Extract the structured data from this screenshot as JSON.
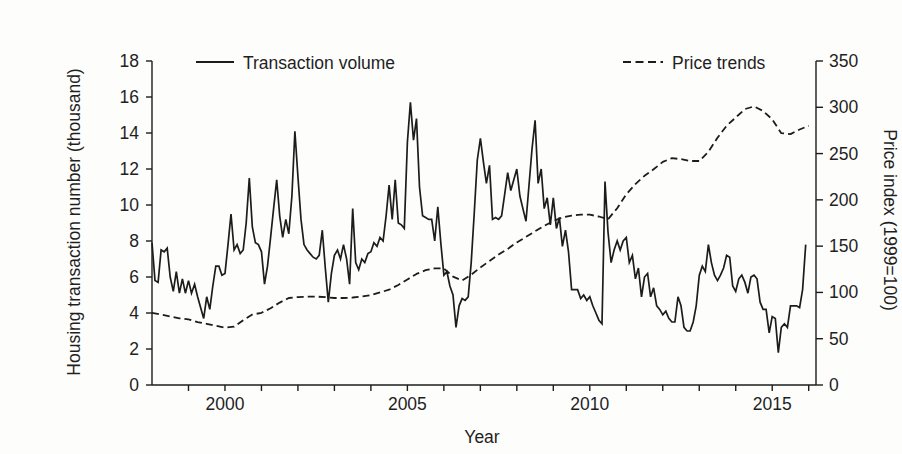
{
  "figure": {
    "colors": {
      "line": "#1c1c1c",
      "text": "#1f1f1f",
      "background": "#fdfdfc"
    }
  },
  "chart_data": {
    "type": "line",
    "title": "",
    "xlabel": "Year",
    "ylabel_left": "Housing transaction number (thousand)",
    "ylabel_right": "Price index (1999=100)",
    "x_range": [
      1998,
      2016.2
    ],
    "x_major_ticks": [
      2000,
      2005,
      2010,
      2015
    ],
    "x_minor_ticks": [
      1999,
      2000,
      2001,
      2002,
      2003,
      2004,
      2005,
      2006,
      2007,
      2008,
      2009,
      2010,
      2011,
      2012,
      2013,
      2014,
      2015,
      2016
    ],
    "yleft_range": [
      0,
      18
    ],
    "yleft_ticks": [
      0,
      2,
      4,
      6,
      8,
      10,
      12,
      14,
      16,
      18
    ],
    "yright_range": [
      0,
      350
    ],
    "yright_ticks": [
      0,
      50,
      100,
      150,
      200,
      250,
      300,
      350
    ],
    "grid": "off",
    "legend": {
      "position": "top",
      "items": [
        {
          "label": "Transaction volume",
          "style": "solid"
        },
        {
          "label": "Price trends",
          "style": "dashed"
        }
      ]
    },
    "series": [
      {
        "name": "Transaction volume",
        "axis": "left",
        "style": "solid",
        "x_start": 1998.0,
        "x_step": 0.083333,
        "values": [
          7.9,
          5.8,
          5.7,
          7.5,
          7.4,
          7.6,
          6.0,
          5.2,
          6.3,
          5.1,
          5.9,
          5.1,
          5.8,
          5.1,
          5.6,
          4.9,
          4.3,
          3.7,
          4.9,
          4.2,
          5.5,
          6.6,
          6.6,
          6.1,
          6.2,
          7.8,
          9.5,
          7.5,
          7.8,
          7.3,
          7.5,
          9.0,
          11.5,
          8.8,
          7.9,
          7.8,
          7.4,
          5.6,
          6.6,
          8.2,
          9.8,
          11.4,
          9.4,
          8.2,
          9.2,
          8.4,
          10.5,
          14.1,
          11.6,
          9.2,
          7.8,
          7.5,
          7.3,
          7.1,
          7.0,
          7.2,
          8.6,
          6.5,
          4.6,
          6.2,
          7.2,
          7.5,
          7.0,
          7.8,
          7.0,
          5.6,
          9.8,
          6.8,
          6.4,
          7.0,
          6.8,
          7.3,
          7.4,
          7.9,
          7.7,
          8.2,
          8.0,
          9.4,
          11.1,
          9.2,
          11.4,
          9.0,
          8.9,
          8.7,
          13.5,
          15.7,
          13.6,
          14.8,
          11.0,
          9.4,
          9.3,
          9.2,
          9.2,
          8.0,
          9.9,
          7.9,
          6.1,
          6.3,
          5.5,
          5.0,
          3.2,
          4.4,
          4.8,
          4.7,
          4.9,
          6.8,
          9.6,
          12.5,
          13.7,
          12.4,
          11.2,
          12.2,
          9.2,
          9.3,
          9.2,
          9.4,
          10.6,
          11.8,
          10.8,
          11.4,
          12.0,
          10.5,
          9.8,
          9.1,
          11.1,
          13.1,
          14.7,
          11.2,
          12.0,
          9.8,
          10.4,
          8.9,
          10.4,
          8.7,
          9.3,
          7.7,
          8.6,
          7.4,
          5.3,
          5.3,
          5.3,
          4.8,
          5.0,
          4.7,
          4.9,
          4.4,
          4.0,
          3.6,
          3.4,
          11.3,
          8.5,
          6.8,
          7.5,
          8.0,
          7.5,
          8.0,
          8.2,
          6.8,
          7.2,
          5.9,
          6.5,
          4.9,
          6.0,
          6.2,
          4.9,
          5.4,
          4.4,
          4.2,
          3.9,
          4.1,
          3.7,
          3.5,
          3.5,
          4.9,
          4.4,
          3.2,
          3.0,
          3.0,
          3.5,
          4.4,
          6.1,
          6.6,
          6.3,
          7.8,
          6.8,
          6.1,
          5.8,
          6.1,
          6.5,
          7.2,
          7.1,
          5.5,
          5.2,
          5.9,
          6.1,
          5.7,
          5.1,
          6.0,
          6.1,
          5.9,
          4.6,
          4.2,
          4.2,
          2.9,
          3.8,
          3.7,
          1.8,
          3.2,
          3.4,
          3.2,
          4.4,
          4.4,
          4.4,
          4.3,
          5.3,
          7.8
        ]
      },
      {
        "name": "Price trends",
        "axis": "right",
        "style": "dashed",
        "x_start": 1998.0,
        "x_step": 0.25,
        "values": [
          78,
          76,
          74,
          72,
          71,
          68,
          66,
          64,
          62,
          63,
          70,
          76,
          78,
          83,
          89,
          94,
          95,
          95.5,
          95.5,
          95,
          94,
          94,
          94.5,
          95.5,
          97,
          100,
          103,
          108,
          114,
          120,
          124,
          126,
          126,
          117,
          113,
          119,
          127,
          134,
          141,
          147,
          154,
          160,
          166,
          172,
          177,
          181,
          183,
          184,
          184,
          182,
          179,
          191,
          206,
          217,
          226,
          233,
          241,
          245,
          244,
          242,
          242,
          252,
          267,
          280,
          289,
          298,
          301,
          296,
          287,
          272,
          271,
          276,
          280
        ]
      }
    ]
  }
}
